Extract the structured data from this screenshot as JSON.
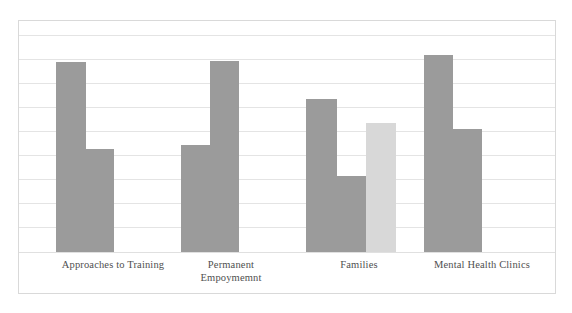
{
  "chart_data": {
    "type": "bar",
    "title": "",
    "subtitle": "",
    "xlabel": "",
    "ylabel": "",
    "ylim": [
      0,
      10
    ],
    "grid": true,
    "gridline_count": 10,
    "legend": [],
    "legend_position": "none",
    "annotations": [],
    "categories": [
      "Approaches to Training",
      "Permanent\nEmpoymemnt",
      "Families",
      "Mental Health Clinics"
    ],
    "category_labels_raw": [
      "Approaches to Training",
      "Permanent Empoymemnt",
      "Families",
      "Mental Health Clinics"
    ],
    "colors": {
      "series_dark": "#9b9b9b",
      "series_light": "#d8d8d8",
      "gridline": "#e4e4e4",
      "frame_border": "#d9d9d9",
      "label_text": "#4f4f4f",
      "background": "#ffffff"
    },
    "series": [
      {
        "name": "Series 1",
        "color": "#9b9b9b",
        "values": [
          8.2,
          4.6,
          7.1,
          9.1
        ]
      },
      {
        "name": "Series 2",
        "color": "#9b9b9b",
        "values": [
          5.2,
          8.3,
          3.4,
          5.9
        ]
      },
      {
        "name": "Series 3",
        "color": "#d8d8d8",
        "values": [
          null,
          null,
          6.1,
          null
        ]
      }
    ],
    "bars": [
      {
        "group": 0,
        "series": 0,
        "x": 55,
        "width": 30,
        "top": 61,
        "height": 190,
        "color": "#9b9b9b",
        "value": 8.2
      },
      {
        "group": 0,
        "series": 1,
        "x": 85,
        "width": 28,
        "top": 148,
        "height": 103,
        "color": "#9b9b9b",
        "value": 4.6
      },
      {
        "group": 1,
        "series": 0,
        "x": 180,
        "width": 29,
        "top": 144,
        "height": 107,
        "color": "#9b9b9b",
        "value": 5.2
      },
      {
        "group": 1,
        "series": 1,
        "x": 209,
        "width": 29,
        "top": 60,
        "height": 191,
        "color": "#9b9b9b",
        "value": 8.3
      },
      {
        "group": 2,
        "series": 0,
        "x": 305,
        "width": 31,
        "top": 98,
        "height": 153,
        "color": "#9b9b9b",
        "value": 7.1
      },
      {
        "group": 2,
        "series": 1,
        "x": 336,
        "width": 29,
        "top": 175,
        "height": 76,
        "color": "#9b9b9b",
        "value": 3.4
      },
      {
        "group": 2,
        "series": 2,
        "x": 365,
        "width": 30,
        "top": 122,
        "height": 129,
        "color": "#d8d8d8",
        "value": 6.1
      },
      {
        "group": 3,
        "series": 0,
        "x": 423,
        "width": 29,
        "top": 54,
        "height": 197,
        "color": "#9b9b9b",
        "value": 9.1
      },
      {
        "group": 3,
        "series": 1,
        "x": 452,
        "width": 29,
        "top": 128,
        "height": 123,
        "color": "#9b9b9b",
        "value": 5.9
      }
    ],
    "gridlines_y": [
      34,
      58,
      82,
      106,
      130,
      154,
      178,
      202,
      226,
      251
    ],
    "label_positions": [
      {
        "left": 22,
        "width": 180
      },
      {
        "left": 150,
        "width": 160
      },
      {
        "left": 278,
        "width": 160
      },
      {
        "left": 392,
        "width": 178
      }
    ]
  }
}
